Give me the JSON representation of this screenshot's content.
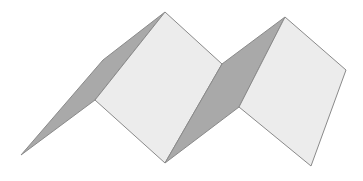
{
  "diagram": {
    "title": "",
    "colors": {
      "background": "#ffffff",
      "light_face": "#ececec",
      "dark_face": "#a9a9a9",
      "edge": "#8a8a8a"
    },
    "faces": [
      {
        "name": "dark-face-1",
        "fill": "dark",
        "points": "21,155 103,60 165,12 95,100"
      },
      {
        "name": "light-face-1",
        "fill": "light",
        "points": "165,12 222,64 165,163 95,100"
      },
      {
        "name": "dark-face-2",
        "fill": "dark",
        "points": "165,163 222,64 285,17 239,107"
      },
      {
        "name": "light-face-2",
        "fill": "light",
        "points": "285,17 346,70 311,166 239,107"
      }
    ]
  }
}
